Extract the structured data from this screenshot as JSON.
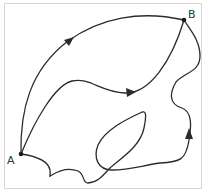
{
  "diagram": {
    "type": "path-diagram",
    "points": [
      {
        "id": "A",
        "label": "A"
      },
      {
        "id": "B",
        "label": "B"
      }
    ],
    "paths": [
      {
        "id": "top-arc",
        "from": "A",
        "to": "B",
        "arrow": true
      },
      {
        "id": "middle-curve",
        "from": "A",
        "to": "B",
        "arrow": true
      },
      {
        "id": "lower-looping-curve",
        "from": "A",
        "to": "B",
        "arrow": true,
        "self_intersecting": true
      }
    ],
    "colors": {
      "stroke": "#2b2b2b",
      "frame": "#d6d6d6",
      "background": "#ffffff"
    }
  }
}
